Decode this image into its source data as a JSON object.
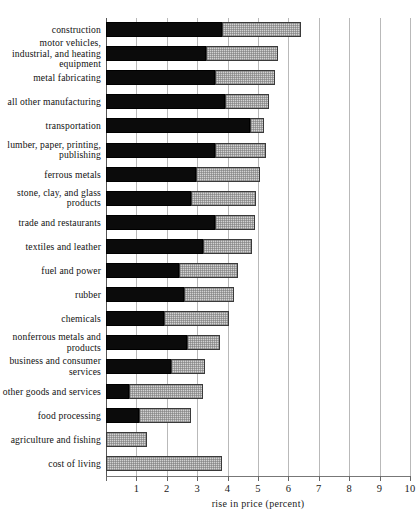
{
  "chart_data": {
    "type": "bar",
    "orientation": "horizontal",
    "stacked": true,
    "title": "",
    "xlabel": "rise in price (percent)",
    "ylabel": "",
    "xlim": [
      0,
      10
    ],
    "xticks": [
      0,
      1,
      2,
      3,
      4,
      5,
      6,
      7,
      8,
      9,
      10
    ],
    "xtick_labels": [
      "",
      "1",
      "2",
      "3",
      "4",
      "5",
      "6",
      "7",
      "8",
      "9",
      "10"
    ],
    "grid": "vertical",
    "legend": "none",
    "categories": [
      "construction",
      "motor vehicles, industrial, and heating equipment",
      "metal fabricating",
      "all other manufacturing",
      "transportation",
      "lumber, paper, printing, publishing",
      "ferrous metals",
      "stone, clay, and glass products",
      "trade and restaurants",
      "textiles and leather",
      "fuel and power",
      "rubber",
      "chemicals",
      "nonferrous metals and products",
      "business and consumer services",
      "other goods and services",
      "food processing",
      "agriculture and fishing",
      "cost of living"
    ],
    "series": [
      {
        "name": "dark-segment",
        "color": "#0b0b0b",
        "values": [
          3.8,
          3.3,
          3.6,
          3.9,
          4.75,
          3.6,
          2.95,
          2.8,
          3.6,
          3.2,
          2.4,
          2.55,
          1.9,
          2.65,
          2.15,
          0.75,
          1.1,
          0.0,
          0.0
        ]
      },
      {
        "name": "light-hatched-segment",
        "color": "#d2d2d2",
        "values": [
          2.6,
          2.35,
          1.95,
          1.45,
          0.45,
          1.65,
          2.1,
          2.15,
          1.3,
          1.6,
          1.95,
          1.65,
          2.15,
          1.1,
          1.1,
          2.45,
          1.7,
          1.35,
          3.8
        ]
      }
    ],
    "totals": [
      6.4,
      5.65,
      5.55,
      5.35,
      5.2,
      5.25,
      5.05,
      4.95,
      4.9,
      4.8,
      4.35,
      4.2,
      4.05,
      3.75,
      3.25,
      3.2,
      2.8,
      1.35,
      3.8
    ]
  }
}
